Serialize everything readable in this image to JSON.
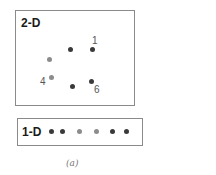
{
  "panel_2d": {
    "label": "2-D",
    "points": [
      {
        "id": "p-a",
        "x": 71,
        "y": 50,
        "tone": "dark",
        "label": ""
      },
      {
        "id": "p-1",
        "x": 93,
        "y": 50,
        "tone": "dark",
        "label": "1"
      },
      {
        "id": "p-b",
        "x": 50,
        "y": 59,
        "tone": "gray",
        "label": ""
      },
      {
        "id": "p-4",
        "x": 51,
        "y": 78,
        "tone": "gray",
        "label": "4"
      },
      {
        "id": "p-c",
        "x": 72,
        "y": 87,
        "tone": "dark",
        "label": ""
      },
      {
        "id": "p-6",
        "x": 91,
        "y": 82,
        "tone": "dark",
        "label": "6"
      }
    ],
    "labels": {
      "one": "1",
      "four": "4",
      "six": "6"
    }
  },
  "panel_1d": {
    "label": "1-D",
    "points": [
      {
        "x": 51,
        "tone": "dark"
      },
      {
        "x": 62,
        "tone": "dark"
      },
      {
        "x": 79,
        "tone": "gray"
      },
      {
        "x": 96,
        "tone": "gray"
      },
      {
        "x": 113,
        "tone": "dark"
      },
      {
        "x": 126,
        "tone": "dark"
      }
    ]
  },
  "caption": "(a)",
  "colors": {
    "dark": "#3a3a3a",
    "gray": "#8c8c8c",
    "border": "#8a8a8a"
  }
}
